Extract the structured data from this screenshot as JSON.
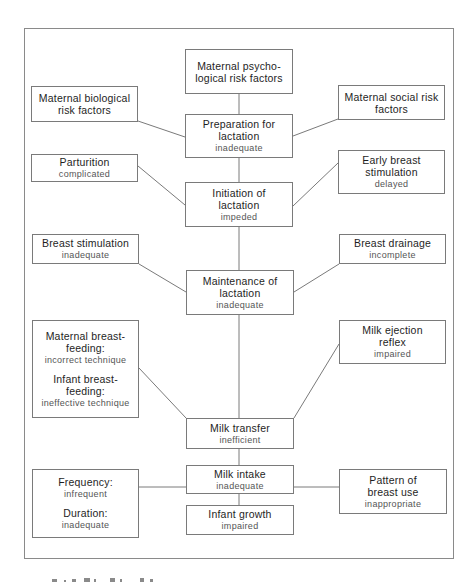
{
  "diagram": {
    "nodes": {
      "psycho": {
        "title": "Maternal psycho-logical risk factors"
      },
      "biological": {
        "title": "Maternal biological risk factors"
      },
      "social": {
        "title": "Maternal social risk factors"
      },
      "preparation": {
        "title": "Preparation for lactation",
        "status": "inadequate"
      },
      "parturition": {
        "title": "Parturition",
        "status": "complicated"
      },
      "early_stimulation": {
        "title": "Early breast stimulation",
        "status": "delayed"
      },
      "initiation": {
        "title": "Initiation of lactation",
        "status": "impeded"
      },
      "breast_stimulation": {
        "title": "Breast stimulation",
        "status": "inadequate"
      },
      "breast_drainage": {
        "title": "Breast drainage",
        "status": "incomplete"
      },
      "maintenance": {
        "title": "Maintenance of lactation",
        "status": "inadequate"
      },
      "feeding": {
        "maternal_title": "Maternal breast-feeding:",
        "maternal_status": "incorrect technique",
        "infant_title": "Infant breast-feeding:",
        "infant_status": "ineffective technique"
      },
      "ejection": {
        "title": "Milk ejection reflex",
        "status": "impaired"
      },
      "transfer": {
        "title": "Milk transfer",
        "status": "inefficient"
      },
      "frequency_duration": {
        "frequency_title": "Frequency:",
        "frequency_status": "infrequent",
        "duration_title": "Duration:",
        "duration_status": "inadequate"
      },
      "intake": {
        "title": "Milk intake",
        "status": "inadequate"
      },
      "pattern": {
        "title": "Pattern of breast use",
        "status": "inappropriate"
      },
      "growth": {
        "title": "Infant growth",
        "status": "impaired"
      }
    },
    "edges": [
      [
        "psycho",
        "preparation"
      ],
      [
        "biological",
        "preparation"
      ],
      [
        "social",
        "preparation"
      ],
      [
        "preparation",
        "initiation"
      ],
      [
        "parturition",
        "initiation"
      ],
      [
        "early_stimulation",
        "initiation"
      ],
      [
        "initiation",
        "maintenance"
      ],
      [
        "breast_stimulation",
        "maintenance"
      ],
      [
        "breast_drainage",
        "maintenance"
      ],
      [
        "maintenance",
        "transfer"
      ],
      [
        "feeding",
        "transfer"
      ],
      [
        "ejection",
        "transfer"
      ],
      [
        "transfer",
        "intake"
      ],
      [
        "frequency_duration",
        "intake"
      ],
      [
        "pattern",
        "intake"
      ],
      [
        "intake",
        "growth"
      ]
    ],
    "colors": {
      "line": "#7a7a7a",
      "title_text": "#1e1e1e",
      "status_text": "#555555"
    }
  }
}
